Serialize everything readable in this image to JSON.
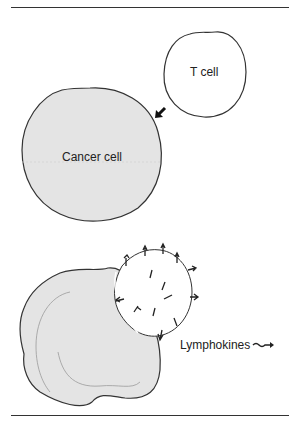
{
  "figure": {
    "labels": {
      "t_cell": "T cell",
      "cancer_cell": "Cancer cell",
      "lymphokines": "Lymphokines"
    },
    "icons": {
      "approach_arrow": "arrow-down-left",
      "lymphokine_symbol": "squiggle-arrow"
    },
    "colors": {
      "cell_fill": "#e4e4e4",
      "outline": "#333333",
      "background": "#ffffff"
    },
    "caption": ""
  }
}
